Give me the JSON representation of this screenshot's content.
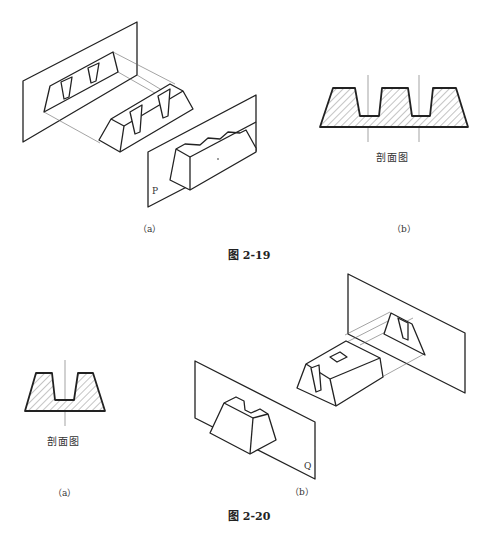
{
  "figures": [
    {
      "id": "2-19",
      "caption": "图 2-19",
      "subfigures": [
        {
          "label": "（a）",
          "plane_label": "P",
          "content": "isometric block with two trapezoidal grooves cut by plane P"
        },
        {
          "label": "（b）",
          "section_label": "剖面图",
          "content": "hatched section with two trapezoidal notches"
        }
      ]
    },
    {
      "id": "2-20",
      "caption": "图 2-20",
      "subfigures": [
        {
          "label": "（a）",
          "section_label": "剖面图",
          "content": "hatched section with one trapezoidal notch"
        },
        {
          "label": "（b）",
          "plane_label": "Q",
          "content": "isometric block with slot and square hole cut by plane Q"
        }
      ]
    }
  ]
}
